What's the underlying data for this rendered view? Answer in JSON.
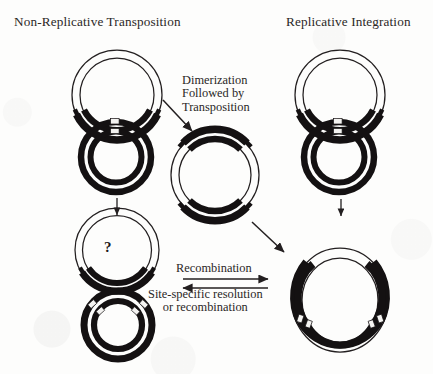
{
  "figure": {
    "titles": {
      "left": "Non-Replicative Transposition",
      "right": "Replicative Integration"
    },
    "captions": {
      "dimerization": {
        "line1": "Dimerization",
        "line2": "Followed by",
        "line3": "Transposition"
      },
      "recombination": {
        "line1": "Recombination"
      },
      "resolution": {
        "line1": "Site-specific resolution",
        "line2": "or recombination"
      }
    },
    "symbols": {
      "unknown_outcome": "?"
    },
    "colors": {
      "ink": "#231f20",
      "transposon_fill": "#141112",
      "background": "#fdfdfc",
      "mark_fill": "#f4f3f1"
    },
    "structures": [
      {
        "name": "donor-plasmid-left",
        "column": "left",
        "row": "top",
        "description": "Thin double-line circular plasmid with thick black transposon arc at bottom",
        "transposon_arcs": 1
      },
      {
        "name": "target-plasmid-left",
        "column": "left",
        "row": "second",
        "description": "Thick black double-ring target circle with small light site marks at top",
        "site_marks": 2
      },
      {
        "name": "donor-after-excision-left",
        "column": "left",
        "row": "third",
        "description": "Thin double-line circle containing question mark with black arc at bottom",
        "label": "?"
      },
      {
        "name": "target-with-insert-left",
        "column": "left",
        "row": "bottom",
        "description": "Thick black double-ring circle with light marks at upper-left and upper-right",
        "site_marks": 4
      },
      {
        "name": "dimer-cointegrate-center",
        "column": "center",
        "row": "middle",
        "description": "Thin double circle with thick black transposon arcs at top and bottom",
        "transposon_arcs": 2
      },
      {
        "name": "donor-plasmid-right",
        "column": "right",
        "row": "top",
        "description": "Thin double-line circular plasmid with thick black transposon arc at bottom",
        "transposon_arcs": 1
      },
      {
        "name": "target-plasmid-right",
        "column": "right",
        "row": "second",
        "description": "Thick black double-ring target circle with small light site marks at top",
        "site_marks": 2
      },
      {
        "name": "cointegrate-right",
        "column": "right",
        "row": "bottom",
        "description": "Large fused co-integrate circle with thick black arcs on left and right flanks and light site marks",
        "site_marks": 4
      }
    ],
    "arrows": [
      {
        "name": "arrow-left-vertical",
        "direction": "down"
      },
      {
        "name": "arrow-right-vertical",
        "direction": "down"
      },
      {
        "name": "arrow-dimerization",
        "direction": "down-right"
      },
      {
        "name": "arrow-to-cointegrate",
        "direction": "down-right"
      },
      {
        "name": "arrow-recombination-forward",
        "direction": "right"
      },
      {
        "name": "arrow-resolution-reverse",
        "direction": "left"
      }
    ]
  }
}
